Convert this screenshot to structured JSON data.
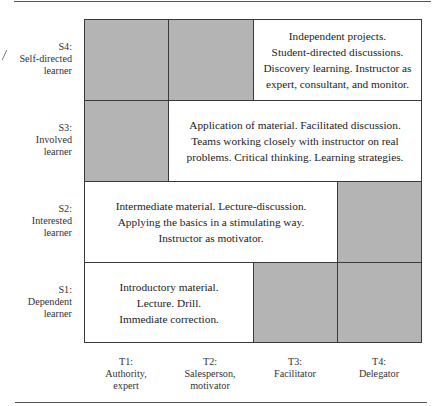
{
  "figure": {
    "type": "staged-self-directed-learning-matrix",
    "rows": [
      {
        "id": "S4",
        "code": "S4:",
        "line1": "Self-directed",
        "line2": "learner"
      },
      {
        "id": "S3",
        "code": "S3:",
        "line1": "Involved",
        "line2": "learner"
      },
      {
        "id": "S2",
        "code": "S2:",
        "line1": "Interested",
        "line2": "learner"
      },
      {
        "id": "S1",
        "code": "S1:",
        "line1": "Dependent",
        "line2": "learner"
      }
    ],
    "columns": [
      {
        "id": "T1",
        "code": "T1:",
        "line1": "Authority,",
        "line2": "expert"
      },
      {
        "id": "T2",
        "code": "T2:",
        "line1": "Salesperson,",
        "line2": "motivator"
      },
      {
        "id": "T3",
        "code": "T3:",
        "line1": "Facilitator",
        "line2": ""
      },
      {
        "id": "T4",
        "code": "T4:",
        "line1": "Delegator",
        "line2": ""
      }
    ],
    "cells": {
      "S4": {
        "shaded": [
          "T1",
          "T2"
        ],
        "text_span": [
          "T3",
          "T4"
        ],
        "lines": [
          "Independent projects.",
          "Student-directed discussions.",
          "Discovery learning. Instructor as",
          "expert, consultant, and monitor."
        ]
      },
      "S3": {
        "shaded": [
          "T1"
        ],
        "text_span": [
          "T2",
          "T3",
          "T4"
        ],
        "lines": [
          "Application of material. Facilitated discussion.",
          "Teams working closely with instructor on real",
          "problems. Critical thinking. Learning strategies."
        ]
      },
      "S2": {
        "shaded": [
          "T4"
        ],
        "text_span": [
          "T1",
          "T2",
          "T3"
        ],
        "lines": [
          "Intermediate material. Lecture-discussion.",
          "Applying the basics in a stimulating way.",
          "Instructor as motivator."
        ]
      },
      "S1": {
        "shaded": [
          "T3",
          "T4"
        ],
        "text_span": [
          "T1",
          "T2"
        ],
        "lines": [
          "Introductory material.",
          "Lecture. Drill.",
          "Immediate correction."
        ]
      }
    },
    "colors": {
      "shade": "#b4b4b4",
      "border": "#3a3a3a",
      "text": "#222222"
    }
  }
}
